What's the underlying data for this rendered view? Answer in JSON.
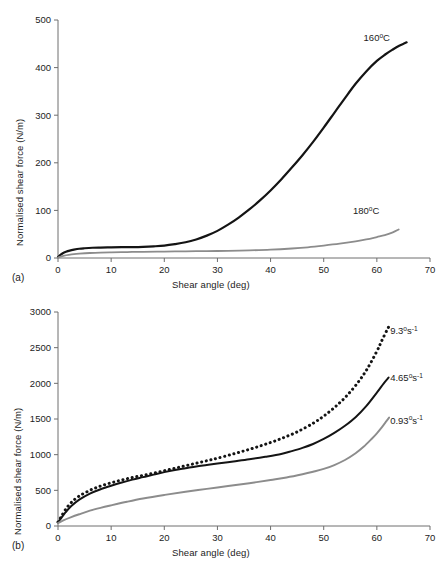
{
  "figure": {
    "panel_a_label": "(a)",
    "panel_b_label": "(b)"
  },
  "colors": {
    "black": "#141414",
    "gray": "#8c8c8c",
    "axis": "#6e6e6e",
    "text": "#1c1c1c",
    "background": "#ffffff"
  },
  "chart_data": [
    {
      "id": "panel-a",
      "type": "line",
      "title": "",
      "xlabel": "Shear angle (deg)",
      "ylabel": "Normalised shear force (N/m)",
      "xlim": [
        0,
        70
      ],
      "ylim": [
        0,
        500
      ],
      "xticks": [
        0,
        10,
        20,
        30,
        40,
        50,
        60,
        70
      ],
      "yticks": [
        0,
        100,
        200,
        300,
        400,
        500
      ],
      "xtick_labels": [
        "0",
        "10",
        "20",
        "30",
        "40",
        "50",
        "60",
        "70"
      ],
      "ytick_labels": [
        "0",
        "100",
        "200",
        "300",
        "400",
        "500"
      ],
      "grid": false,
      "legend_position": "inline-annotation",
      "series": [
        {
          "name": "160°C",
          "label_html": "160<sup>o</sup>C",
          "label_x": 57.5,
          "label_y": 455,
          "color": "#141414",
          "style": "solid",
          "width": 2.2,
          "x": [
            0,
            0.4,
            0.9,
            1.5,
            2.2,
            3,
            4,
            5,
            6.5,
            8,
            10,
            12,
            14,
            16,
            18,
            20,
            22,
            24,
            26,
            28,
            30,
            32,
            34,
            36,
            38,
            40,
            42,
            44,
            46,
            48,
            50,
            52,
            54,
            56,
            58,
            60,
            61.5,
            63,
            64.2,
            65.2,
            65.6
          ],
          "y": [
            2,
            6,
            10,
            13,
            15.5,
            17.5,
            19.5,
            20.5,
            21.5,
            22,
            22.5,
            22.8,
            23,
            23.5,
            24.5,
            26,
            29,
            33,
            39,
            47,
            57,
            70,
            85,
            102,
            121,
            142,
            165,
            190,
            216,
            244,
            274,
            305,
            336,
            366,
            392,
            414,
            427,
            438,
            446,
            451,
            453
          ]
        },
        {
          "name": "180°C",
          "label_html": "180<sup>o</sup>C",
          "label_x": 55.5,
          "label_y": 92,
          "color": "#8c8c8c",
          "style": "solid",
          "width": 1.8,
          "x": [
            0,
            0.5,
            1.2,
            2,
            3,
            4,
            6,
            8,
            10,
            13,
            16,
            20,
            24,
            28,
            32,
            36,
            40,
            44,
            47,
            50,
            53,
            56,
            58,
            60,
            61.5,
            63,
            64.1
          ],
          "y": [
            1,
            3,
            5,
            6.5,
            8,
            9,
            10.5,
            11.5,
            12,
            12.5,
            13,
            13.5,
            14,
            14.5,
            15,
            16,
            17.5,
            20,
            22.5,
            26,
            30,
            35,
            39,
            44,
            48,
            54,
            60
          ]
        }
      ]
    },
    {
      "id": "panel-b",
      "type": "line",
      "title": "",
      "xlabel": "Shear angle (deg)",
      "ylabel": "Normalised shear force (N/m)",
      "xlim": [
        0,
        70
      ],
      "ylim": [
        0,
        3000
      ],
      "xticks": [
        0,
        10,
        20,
        30,
        40,
        50,
        60,
        70
      ],
      "yticks": [
        0,
        500,
        1000,
        1500,
        2000,
        2500,
        3000
      ],
      "xtick_labels": [
        "0",
        "10",
        "20",
        "30",
        "40",
        "50",
        "60",
        "70"
      ],
      "ytick_labels": [
        "0",
        "500",
        "1000",
        "1500",
        "2000",
        "2500",
        "3000"
      ],
      "grid": false,
      "legend_position": "inline-annotation",
      "series": [
        {
          "name": "9.3°s⁻¹",
          "label_value": "9.3",
          "label_unit_deg": "o",
          "label_unit_s": "s",
          "label_unit_exp": "-1",
          "label_x": 62.5,
          "label_y": 2690,
          "color": "#141414",
          "style": "dotted",
          "width": 3.0,
          "x": [
            0,
            0.6,
            1.4,
            2.5,
            4,
            6,
            8,
            10,
            12,
            14,
            16,
            18,
            20,
            22,
            24,
            26,
            28,
            30,
            33,
            36,
            39,
            42,
            45,
            48,
            50,
            52,
            54,
            56,
            58,
            60,
            61,
            62,
            62.4
          ],
          "y": [
            55,
            130,
            230,
            330,
            420,
            500,
            560,
            605,
            645,
            680,
            710,
            740,
            775,
            810,
            845,
            880,
            915,
            950,
            1010,
            1075,
            1145,
            1225,
            1320,
            1440,
            1540,
            1660,
            1800,
            1970,
            2180,
            2450,
            2610,
            2760,
            2815
          ]
        },
        {
          "name": "4.65°s⁻¹",
          "label_value": "4.65",
          "label_unit_deg": "o",
          "label_unit_s": "s",
          "label_unit_exp": "-1",
          "label_x": 62.5,
          "label_y": 2030,
          "color": "#141414",
          "style": "solid",
          "width": 2.0,
          "x": [
            0,
            0.6,
            1.4,
            2.5,
            4,
            6,
            8,
            10,
            12,
            14,
            16,
            18,
            20,
            22,
            24,
            26,
            28,
            30,
            33,
            36,
            39,
            42,
            44,
            46,
            48,
            50,
            52,
            54,
            56,
            58,
            60,
            61.3,
            62.2
          ],
          "y": [
            50,
            110,
            190,
            280,
            370,
            455,
            515,
            565,
            610,
            650,
            685,
            720,
            755,
            785,
            810,
            835,
            855,
            875,
            905,
            935,
            970,
            1010,
            1050,
            1095,
            1150,
            1220,
            1305,
            1405,
            1525,
            1680,
            1870,
            2000,
            2080
          ]
        },
        {
          "name": "0.93°s⁻¹",
          "label_value": "0.93",
          "label_unit_deg": "o",
          "label_unit_s": "s",
          "label_unit_exp": "-1",
          "label_x": 62.5,
          "label_y": 1435,
          "color": "#8c8c8c",
          "style": "solid",
          "width": 1.9,
          "x": [
            0,
            1,
            2.5,
            4,
            6,
            8,
            10,
            13,
            16,
            20,
            24,
            28,
            32,
            36,
            40,
            43,
            46,
            48,
            50,
            52,
            54,
            56,
            57.5,
            59,
            60,
            61,
            61.8,
            62.3
          ],
          "y": [
            40,
            80,
            125,
            165,
            215,
            255,
            290,
            340,
            385,
            435,
            480,
            520,
            560,
            600,
            645,
            680,
            725,
            760,
            800,
            855,
            925,
            1020,
            1110,
            1220,
            1300,
            1390,
            1470,
            1520
          ]
        }
      ]
    }
  ]
}
